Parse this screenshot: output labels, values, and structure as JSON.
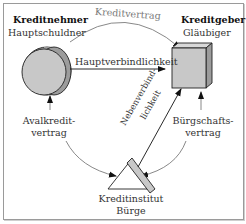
{
  "nodes": {
    "debtor": {
      "role": "Kreditnehmer",
      "subtitle": "Hauptschuldner",
      "shape": "cylinder-disc"
    },
    "creditor": {
      "role": "Kreditgeber",
      "subtitle": "Gläubiger",
      "shape": "cube"
    },
    "guarantor": {
      "role": "Kreditinstitut",
      "subtitle": "Bürge",
      "shape": "triangle"
    }
  },
  "edges": {
    "credit_contract": {
      "label": "Kreditvertrag",
      "from": "debtor",
      "to": "creditor",
      "style": "curved-gray-arrow"
    },
    "main_liability": {
      "label": "Hauptverbindlichkeit",
      "from": "debtor",
      "to": "creditor",
      "style": "straight-black-arrow"
    },
    "aval_contract": {
      "label_line1": "Avalkredit-",
      "label_line2": "vertrag",
      "from": "debtor",
      "to": "guarantor",
      "style": "curved-gray-double-arrow"
    },
    "surety_contract": {
      "label_line1": "Bürgschafts-",
      "label_line2": "vertrag",
      "from": "creditor",
      "to": "guarantor",
      "style": "curved-gray-double-arrow"
    },
    "secondary_liability": {
      "label_line1": "Nebenverbind-",
      "label_line2": "lichkeit",
      "from": "guarantor",
      "to": "creditor",
      "style": "straight-black-arrow"
    }
  },
  "colors": {
    "shape_fill": "#c8c8c8",
    "shape_side": "#9c9c9c",
    "stroke": "#222222",
    "gray_arrow": "#7a7a7a",
    "frame": "#9a9a9a"
  }
}
